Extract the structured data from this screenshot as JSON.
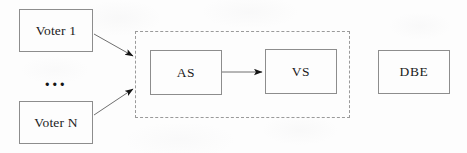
{
  "diagram": {
    "canvas": {
      "width": 467,
      "height": 153
    },
    "background_color": "#fdfdfd",
    "stroke_color": "#8d8d8d",
    "dashed_stroke_color": "#9a9a9a",
    "text_color": "#1b1b1b",
    "nodes": [
      {
        "id": "voter-1",
        "label": "Voter 1",
        "shape": "rectangle",
        "x": 19,
        "y": 9,
        "width": 74,
        "height": 43
      },
      {
        "id": "voter-n",
        "label": "Voter N",
        "shape": "rectangle",
        "x": 19,
        "y": 101,
        "width": 74,
        "height": 43
      },
      {
        "id": "as",
        "label": "AS",
        "shape": "rectangle",
        "x": 150,
        "y": 50,
        "width": 72,
        "height": 45
      },
      {
        "id": "vs",
        "label": "VS",
        "shape": "rectangle",
        "x": 265,
        "y": 49,
        "width": 72,
        "height": 45
      },
      {
        "id": "dbe",
        "label": "DBE",
        "shape": "rectangle",
        "x": 378,
        "y": 50,
        "width": 72,
        "height": 44
      }
    ],
    "ellipsis": {
      "label": "...",
      "x": 19,
      "y": 66,
      "width": 74,
      "height": 26
    },
    "group": {
      "id": "trust-boundary",
      "label": "",
      "style": "dashed",
      "x": 135,
      "y": 31,
      "width": 215,
      "height": 87
    },
    "edges": [
      {
        "id": "voter-1-to-boundary",
        "from": "voter-1",
        "to": "trust-boundary",
        "label": "",
        "arrowhead": "filled-triangle",
        "x1": 94,
        "y1": 34,
        "x2": 135,
        "y2": 57
      },
      {
        "id": "voter-n-to-boundary",
        "from": "voter-n",
        "to": "trust-boundary",
        "label": "",
        "arrowhead": "filled-triangle",
        "x1": 94,
        "y1": 115,
        "x2": 135,
        "y2": 88
      },
      {
        "id": "as-to-vs",
        "from": "as",
        "to": "vs",
        "label": "",
        "arrowhead": "filled-triangle",
        "x1": 222,
        "y1": 72,
        "x2": 264,
        "y2": 72
      }
    ]
  }
}
